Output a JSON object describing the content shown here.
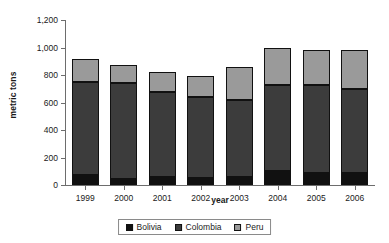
{
  "chart_data": {
    "type": "bar",
    "stacked": true,
    "title": "",
    "xlabel": "year",
    "ylabel": "metric tons",
    "ylim": [
      0,
      1200
    ],
    "yticks": [
      0,
      200,
      400,
      600,
      800,
      1000,
      1200
    ],
    "ytick_labels": [
      "0",
      "200",
      "400",
      "600",
      "800",
      "1,000",
      "1,200"
    ],
    "grid": false,
    "legend_position": "bottom-center",
    "categories": [
      "1999",
      "2000",
      "2001",
      "2002",
      "2003",
      "2004",
      "2005",
      "2006"
    ],
    "series": [
      {
        "name": "Bolivia",
        "color": "#111111",
        "values": [
          70,
          45,
          55,
          50,
          60,
          100,
          85,
          90
        ]
      },
      {
        "name": "Colombia",
        "color": "#3c3c3c",
        "values": [
          680,
          695,
          620,
          590,
          555,
          630,
          640,
          610
        ]
      },
      {
        "name": "Peru",
        "color": "#9a9a9a",
        "values": [
          170,
          135,
          150,
          155,
          240,
          270,
          255,
          285
        ]
      }
    ],
    "totals": [
      920,
      875,
      825,
      795,
      855,
      1000,
      980,
      985
    ]
  },
  "legend": {
    "items": [
      {
        "label": "Bolivia"
      },
      {
        "label": "Colombia"
      },
      {
        "label": "Peru"
      }
    ]
  }
}
